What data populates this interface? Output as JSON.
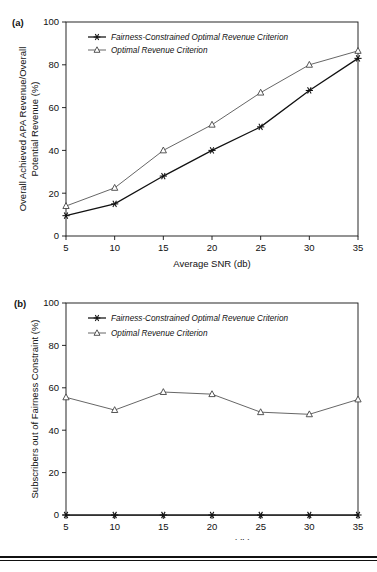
{
  "figure": {
    "panels": [
      {
        "id": "a",
        "label": "(a)"
      },
      {
        "id": "b",
        "label": "(b)"
      }
    ]
  },
  "chart_data": [
    {
      "type": "line",
      "panel_label": "(a)",
      "title": "",
      "xlabel": "Average SNR (db)",
      "ylabel": "Overall Achieved APA Revenue/Overall Potential Revenue (%)",
      "ylabel_line1": "Overall Achieved APA Revenue/Overall",
      "ylabel_line2": "Potential Revenue (%)",
      "x": [
        5,
        10,
        15,
        20,
        25,
        30,
        35
      ],
      "xticklabels": [
        "5",
        "10",
        "15",
        "20",
        "25",
        "30",
        "35"
      ],
      "yticks": [
        0,
        20,
        40,
        60,
        80,
        100
      ],
      "yticklabels": [
        "0",
        "20",
        "40",
        "60",
        "80",
        "100"
      ],
      "xlim": [
        5,
        35
      ],
      "ylim": [
        0,
        100
      ],
      "grid": false,
      "legend_position": "upper-left-inside",
      "series": [
        {
          "name": "Fairness-Constrained Optimal Revenue Criterion",
          "marker": "star",
          "color": "#111111",
          "values": [
            9.5,
            15,
            28,
            40,
            51,
            68,
            83
          ]
        },
        {
          "name": "Optimal Revenue Criterion",
          "marker": "triangle",
          "color": "#555555",
          "values": [
            14,
            22.5,
            40,
            52,
            67,
            80,
            86.5
          ]
        }
      ]
    },
    {
      "type": "line",
      "panel_label": "(b)",
      "title": "",
      "xlabel": "Average SNR (db)",
      "ylabel": "Subscribers out of Fairness Constraint (%)",
      "x": [
        5,
        10,
        15,
        20,
        25,
        30,
        35
      ],
      "xticklabels": [
        "5",
        "10",
        "15",
        "20",
        "25",
        "30",
        "35"
      ],
      "yticks": [
        0,
        20,
        40,
        60,
        80,
        100
      ],
      "yticklabels": [
        "0",
        "20",
        "40",
        "60",
        "80",
        "100"
      ],
      "xlim": [
        5,
        35
      ],
      "ylim": [
        0,
        100
      ],
      "grid": false,
      "legend_position": "upper-left-inside",
      "series": [
        {
          "name": "Fairness-Constrained Optimal Revenue Criterion",
          "marker": "star",
          "color": "#111111",
          "values": [
            0,
            0,
            0,
            0,
            0,
            0,
            0
          ]
        },
        {
          "name": "Optimal Revenue Criterion",
          "marker": "triangle",
          "color": "#555555",
          "values": [
            55.5,
            49.5,
            58,
            57,
            48.5,
            47.5,
            54.5
          ]
        }
      ]
    }
  ]
}
